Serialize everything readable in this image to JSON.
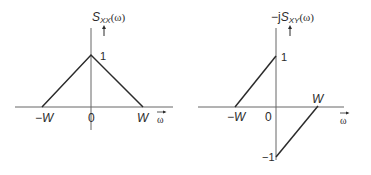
{
  "left_plot": {
    "title_prefix": "",
    "title_symbol": "S",
    "title_subscript": "XX",
    "title_arg": "(ω)",
    "peak_label": "1",
    "x_ticks": [
      "−W",
      "0",
      "W"
    ],
    "x_axis_label": "ω"
  },
  "right_plot": {
    "title_prefix": "−j",
    "title_symbol": "S",
    "title_subscript": "XY",
    "title_arg": "(ω)",
    "top_label": "1",
    "bottom_label": "−1",
    "x_ticks": [
      "−W",
      "0",
      "W"
    ],
    "x_axis_label": "ω"
  },
  "colors": {
    "line": "#2b2b2b",
    "axis": "#555555",
    "background": "#ffffff"
  }
}
